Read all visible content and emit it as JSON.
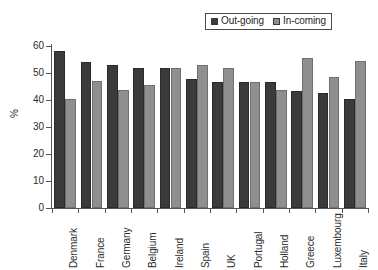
{
  "chart_data": {
    "type": "bar",
    "title": "",
    "xlabel": "",
    "ylabel": "%",
    "ylim": [
      0,
      60
    ],
    "yticks": [
      0,
      10,
      20,
      30,
      40,
      50,
      60
    ],
    "grid": false,
    "legend_position": "top-right",
    "categories": [
      "Denmark",
      "France",
      "Germany",
      "Belgium",
      "Ireland",
      "Spain",
      "UK",
      "Portugal",
      "Holland",
      "Greece",
      "Luxembourg",
      "Italy"
    ],
    "series": [
      {
        "name": "Out-going",
        "color": "#3b3b3b",
        "values": [
          58.0,
          54.0,
          52.8,
          51.8,
          51.8,
          47.7,
          46.8,
          46.7,
          46.8,
          43.5,
          42.7,
          40.4
        ]
      },
      {
        "name": "In-coming",
        "color": "#8f8f8f",
        "values": [
          40.5,
          46.9,
          43.8,
          45.7,
          51.8,
          52.8,
          51.8,
          46.7,
          43.7,
          55.6,
          48.7,
          54.5
        ]
      }
    ]
  },
  "legend": {
    "entries": [
      {
        "label": "Out-going",
        "color": "#3b3b3b"
      },
      {
        "label": "In-coming",
        "color": "#8f8f8f"
      }
    ]
  },
  "axis": {
    "y_title": "%",
    "y_tick_labels": [
      "60",
      "50",
      "40",
      "30",
      "20",
      "10",
      "0"
    ]
  },
  "x_labels": [
    "Denmark",
    "France",
    "Germany",
    "Belgium",
    "Ireland",
    "Spain",
    "UK",
    "Portugal",
    "Holland",
    "Greece",
    "Luxembourg",
    "Italy"
  ]
}
